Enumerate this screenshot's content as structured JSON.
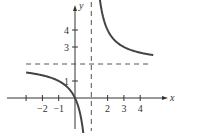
{
  "chart_data": {
    "type": "line",
    "title": "",
    "xlabel": "x",
    "ylabel": "y",
    "function": "y = 2 + 2/(x - 1)",
    "x_ticks": [
      -3,
      -2,
      -1,
      2,
      3,
      4
    ],
    "x_tick_labels": [
      "",
      "−2",
      "−1",
      "2",
      "3",
      "4"
    ],
    "y_ticks": [
      1,
      3,
      4
    ],
    "y_tick_labels": [
      "1",
      "3",
      "4"
    ],
    "asymptotes": {
      "vertical": 1,
      "horizontal": 2
    },
    "series": [
      {
        "name": "left-branch",
        "x": [
          -3,
          -2,
          -1,
          -0.5,
          0,
          0.3,
          0.5
        ],
        "y": [
          1.5,
          1.33,
          1,
          0.67,
          0,
          -0.86,
          -2
        ]
      },
      {
        "name": "right-branch",
        "x": [
          1.45,
          1.75,
          2,
          2.5,
          3,
          4,
          4.8
        ],
        "y": [
          6.44,
          4.67,
          4,
          3.33,
          3,
          2.67,
          2.53
        ]
      }
    ],
    "xlim": [
      -3.3,
      4.9
    ],
    "ylim": [
      -2.1,
      5.7
    ],
    "grid": false,
    "legend": null
  },
  "colors": {
    "curve": "#444444",
    "axis": "#333333",
    "asymptote": "#555555"
  }
}
